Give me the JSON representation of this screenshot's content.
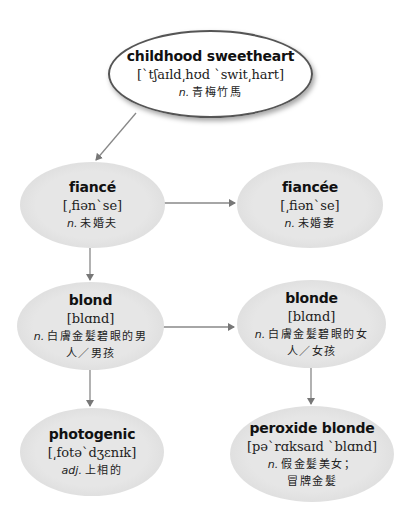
{
  "nodes": {
    "childhood_sweetheart": {
      "word": "childhood sweetheart",
      "ipa": "[ˋtʃaɪld͵hʊd ˋswit͵hart]",
      "pos": "n.",
      "def": "青梅竹馬"
    },
    "fiance": {
      "word": "fiancé",
      "ipa": "[͵fiənˋse]",
      "pos": "n.",
      "def": "未婚夫"
    },
    "fiancee": {
      "word": "fiancée",
      "ipa": "[͵fiənˋse]",
      "pos": "n.",
      "def": "未婚妻"
    },
    "blond": {
      "word": "blond",
      "ipa": "[blɑnd]",
      "pos": "n.",
      "def_line1": "白膚金髮碧眼的男",
      "def_line2": "人／男孩"
    },
    "blonde": {
      "word": "blonde",
      "ipa": "[blɑnd]",
      "pos": "n.",
      "def_line1": "白膚金髮碧眼的女",
      "def_line2": "人／女孩"
    },
    "photogenic": {
      "word": "photogenic",
      "ipa": "[͵fotəˋdʒɛnɪk]",
      "pos": "adj.",
      "def": "上相的"
    },
    "peroxide_blonde": {
      "word": "peroxide blonde",
      "ipa": "[pəˋrɑksaɪd ˋblɑnd]",
      "pos": "n.",
      "def_line1": "假金髮美女；",
      "def_line2": "冒牌金髮"
    }
  },
  "edges": [
    {
      "from": "childhood_sweetheart",
      "to": "fiance"
    },
    {
      "from": "fiance",
      "to": "fiancee"
    },
    {
      "from": "fiance",
      "to": "blond"
    },
    {
      "from": "blond",
      "to": "blonde"
    },
    {
      "from": "blond",
      "to": "photogenic"
    },
    {
      "from": "blonde",
      "to": "peroxide_blonde"
    }
  ],
  "colors": {
    "node_fill": "#e4e4e4",
    "root_fill": "#ffffff",
    "root_border": "#555555",
    "arrow": "#777777"
  }
}
